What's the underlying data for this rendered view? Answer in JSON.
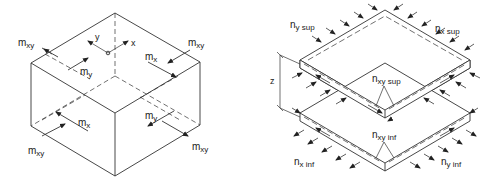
{
  "left_figure": {
    "description": "Cube element with bending and twisting moments",
    "axis_labels": {
      "x": "x",
      "y": "y"
    },
    "labels": [
      {
        "id": "mxy_top_left",
        "main": "m",
        "sub": "xy",
        "x": 18,
        "y": 46
      },
      {
        "id": "my_top",
        "main": "m",
        "sub": "y",
        "x": 80,
        "y": 75
      },
      {
        "id": "mx_top",
        "main": "m",
        "sub": "x",
        "x": 145,
        "y": 60
      },
      {
        "id": "mxy_top_right",
        "main": "m",
        "sub": "xy",
        "x": 188,
        "y": 46
      },
      {
        "id": "mx_bottom",
        "main": "m",
        "sub": "x",
        "x": 78,
        "y": 126
      },
      {
        "id": "my_bottom",
        "main": "m",
        "sub": "y",
        "x": 145,
        "y": 120
      },
      {
        "id": "mxy_bottom_left",
        "main": "m",
        "sub": "xy",
        "x": 28,
        "y": 154
      },
      {
        "id": "mxy_bottom_right",
        "main": "m",
        "sub": "xy",
        "x": 192,
        "y": 150
      }
    ]
  },
  "right_figure": {
    "description": "Sandwich model with upper and lower membrane layers",
    "dimension_label": "z",
    "labels": [
      {
        "id": "ny_sup",
        "main": "n",
        "sub": "y sup",
        "x": 290,
        "y": 28
      },
      {
        "id": "nx_sup",
        "main": "n",
        "sub": "x sup",
        "x": 435,
        "y": 32
      },
      {
        "id": "nxy_sup",
        "main": "n",
        "sub": "xy sup",
        "x": 372,
        "y": 82
      },
      {
        "id": "nxy_inf",
        "main": "n",
        "sub": "xy inf",
        "x": 372,
        "y": 138
      },
      {
        "id": "nx_inf",
        "main": "n",
        "sub": "x inf",
        "x": 294,
        "y": 165
      },
      {
        "id": "ny_inf",
        "main": "n",
        "sub": "y inf",
        "x": 441,
        "y": 165
      }
    ]
  }
}
